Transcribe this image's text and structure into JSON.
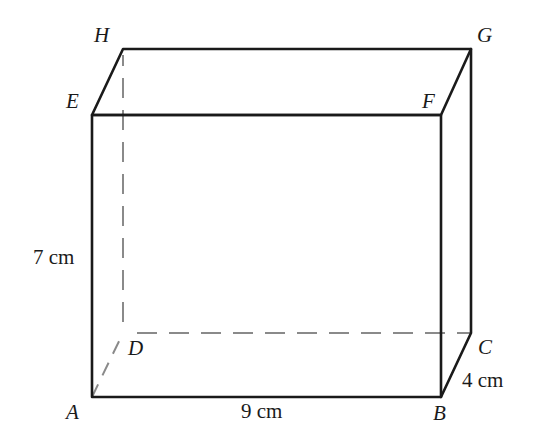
{
  "diagram": {
    "type": "cuboid",
    "vertices": {
      "A": {
        "label": "A",
        "x": 92,
        "y": 397
      },
      "B": {
        "label": "B",
        "x": 441,
        "y": 397
      },
      "C": {
        "label": "C",
        "x": 471,
        "y": 333
      },
      "D": {
        "label": "D",
        "x": 123,
        "y": 333
      },
      "E": {
        "label": "E",
        "x": 92,
        "y": 115
      },
      "F": {
        "label": "F",
        "x": 441,
        "y": 115
      },
      "G": {
        "label": "G",
        "x": 471,
        "y": 49
      },
      "H": {
        "label": "H",
        "x": 123,
        "y": 49
      }
    },
    "dimensions": {
      "height": "7 cm",
      "length": "9 cm",
      "width": "4 cm"
    },
    "hidden_edges": [
      "AD",
      "DC",
      "DH"
    ],
    "colors": {
      "edge": "#1a1a1a",
      "hidden_edge": "#8a8a8a"
    }
  }
}
